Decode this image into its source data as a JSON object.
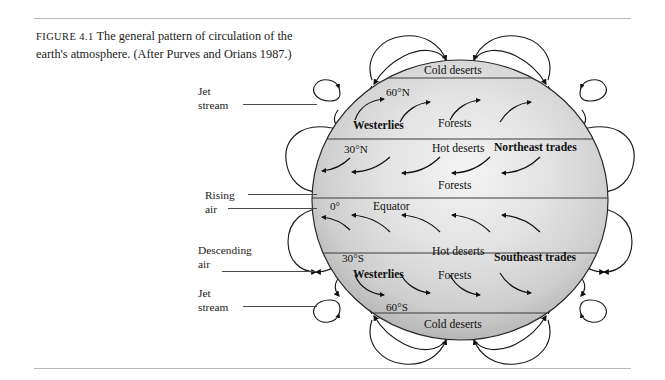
{
  "figure": {
    "number_label": "FIGURE 4.1",
    "caption": "The general pattern of circulation of the earth's atmosphere. (After Purves and Orians 1987.)"
  },
  "callouts": [
    {
      "name": "jet-stream-north",
      "line1": "Jet",
      "line2": "stream"
    },
    {
      "name": "rising-air",
      "line1": "Rising",
      "line2": "air"
    },
    {
      "name": "descending-air",
      "line1": "Descending",
      "line2": "air"
    },
    {
      "name": "jet-stream-south",
      "line1": "Jet",
      "line2": "stream"
    }
  ],
  "globe": {
    "latitudes": [
      {
        "name": "lat-60n",
        "label": "60°N"
      },
      {
        "name": "lat-30n",
        "label": "30°N"
      },
      {
        "name": "lat-0",
        "label": "0°"
      },
      {
        "name": "lat-30s",
        "label": "30°S"
      },
      {
        "name": "lat-60s",
        "label": "60°S"
      }
    ],
    "equator_label": "Equator",
    "biomes": [
      {
        "name": "biome-cold-deserts-north",
        "label": "Cold deserts"
      },
      {
        "name": "biome-forests-north-high",
        "label": "Forests"
      },
      {
        "name": "biome-hot-deserts-north",
        "label": "Hot deserts"
      },
      {
        "name": "biome-forests-north-low",
        "label": "Forests"
      },
      {
        "name": "biome-hot-deserts-south",
        "label": "Hot deserts"
      },
      {
        "name": "biome-forests-south",
        "label": "Forests"
      },
      {
        "name": "biome-cold-deserts-south",
        "label": "Cold deserts"
      }
    ],
    "winds": [
      {
        "name": "wind-westerlies-north",
        "label": "Westerlies"
      },
      {
        "name": "wind-northeast-trades",
        "label": "Northeast trades"
      },
      {
        "name": "wind-southeast-trades",
        "label": "Southeast trades"
      },
      {
        "name": "wind-westerlies-south",
        "label": "Westerlies"
      }
    ]
  },
  "colors": {
    "rule": "#b9b9b9",
    "ink": "#111111",
    "leader": "#4a4a4a",
    "globe_light": "#f2f2f2",
    "globe_mid": "#d2d2d2",
    "globe_dark": "#a8a8a8",
    "band_line": "#3b3b3b"
  }
}
